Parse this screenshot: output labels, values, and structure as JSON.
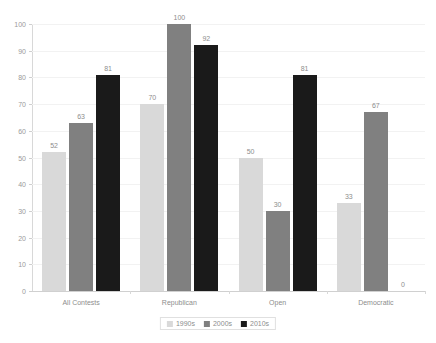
{
  "chart_data": {
    "type": "bar",
    "title": "",
    "subtitle": "",
    "xlabel": "",
    "ylabel": "",
    "ylim": [
      0,
      100
    ],
    "yticks": [
      0,
      10,
      20,
      30,
      40,
      50,
      60,
      70,
      80,
      90,
      100
    ],
    "grid": true,
    "legend_position": "bottom-center",
    "categories": [
      "All Contests",
      "Republican",
      "Open",
      "Democratic"
    ],
    "series": [
      {
        "name": "1990s",
        "color": "#d9d9d9",
        "values": [
          52,
          70,
          50,
          33
        ]
      },
      {
        "name": "2000s",
        "color": "#808080",
        "values": [
          63,
          100,
          30,
          67
        ]
      },
      {
        "name": "2010s",
        "color": "#1a1a1a",
        "values": [
          81,
          92,
          81,
          0
        ]
      }
    ],
    "data_labels": [
      [
        "52",
        "63",
        "81"
      ],
      [
        "70",
        "100",
        "92"
      ],
      [
        "50",
        "30",
        "81"
      ],
      [
        "33",
        "67",
        "0"
      ]
    ]
  },
  "legend": {
    "items": [
      {
        "label": "1990s",
        "key": "s1990s"
      },
      {
        "label": "2000s",
        "key": "s2000s"
      },
      {
        "label": "2010s",
        "key": "s2010s"
      }
    ]
  }
}
